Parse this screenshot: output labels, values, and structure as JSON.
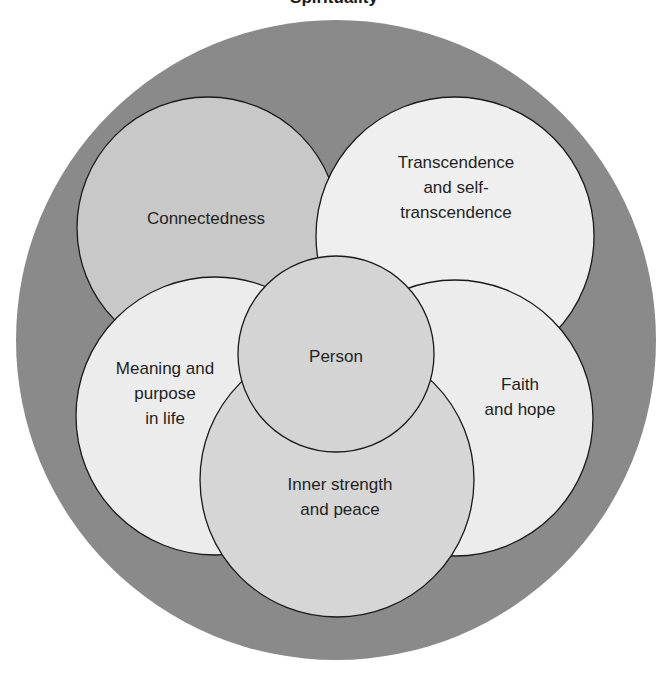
{
  "diagram": {
    "title": "Spirituality",
    "type": "nested-venn",
    "colors": {
      "outer_ring": "#8a8a8a",
      "connectedness_fill": "#c8c8c8",
      "transcendence_fill": "#efefef",
      "meaning_fill": "#ececec",
      "faith_fill": "#ececec",
      "inner_strength_fill": "#d6d6d6",
      "person_fill": "#d4d4d4",
      "stroke": "#1a1a1a"
    },
    "circles": {
      "connectedness": {
        "label": "Connectedness"
      },
      "transcendence": {
        "line1": "Transcendence",
        "line2": "and self-",
        "line3": "transcendence"
      },
      "meaning": {
        "line1": "Meaning and",
        "line2": "purpose",
        "line3": "in life"
      },
      "faith": {
        "line1": "Faith",
        "line2": "and hope"
      },
      "inner_strength": {
        "line1": "Inner strength",
        "line2": "and peace"
      },
      "person": {
        "label": "Person"
      }
    }
  }
}
